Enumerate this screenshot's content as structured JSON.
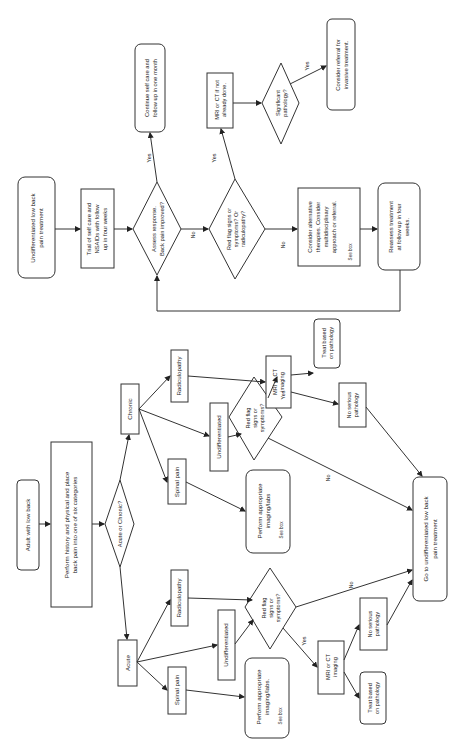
{
  "diagram": {
    "orientation": "rotated 90 degrees counter-clockwise",
    "nodes": {
      "adult": [
        "Adult with low back"
      ],
      "history": [
        "Perform history and physical and place",
        "back pain into one of six categories"
      ],
      "acute_chronic": [
        "Acute or Chronic?"
      ],
      "acute": [
        "Acute"
      ],
      "chronic": [
        "Chronic"
      ],
      "acute_spinal": [
        "Spinal pain"
      ],
      "acute_undiff": [
        "Undifferentiated"
      ],
      "acute_radic": [
        "Radiculopathy"
      ],
      "chronic_spinal": [
        "Spinal pain"
      ],
      "chronic_undiff": [
        "Undifferentiated"
      ],
      "chronic_radic": [
        "Radiculopathy"
      ],
      "acute_imaging_labs": [
        "Perform appropriate",
        "imaging/labs."
      ],
      "acute_imaging_labs_note": "See box",
      "chronic_imaging_labs": [
        "Perform appropriate",
        "imaging/labs"
      ],
      "chronic_imaging_labs_note": "See box",
      "acute_redflag": [
        "Red flag",
        "signs or",
        "symptoms?"
      ],
      "chronic_redflag": [
        "Red flag",
        "signs or",
        "symptoms?"
      ],
      "acute_mri": [
        "MRI or CT",
        "imaging"
      ],
      "chronic_mri": [
        "MRI or CT",
        "imaging"
      ],
      "acute_treat": [
        "Treat based",
        "on pathology"
      ],
      "chronic_treat": [
        "Treat based",
        "on pathology"
      ],
      "acute_noserious": [
        "No serious",
        "pathology"
      ],
      "chronic_noserious": [
        "No serious",
        "pathology"
      ],
      "goto_undiff": [
        "Go to undifferentiated low back",
        "pain treatment"
      ],
      "undiff_treatment": [
        "Undifferentiated low back",
        "pain treatment"
      ],
      "trial_selfcare": [
        "Trial of self care and",
        "NSAIDs with follow",
        "up in four weeks"
      ],
      "assess_response": [
        "Assess response.",
        "Back pain improved?"
      ],
      "continue_selfcare": [
        "Continue self care and",
        "follow up in one month"
      ],
      "redflag_radic": [
        "Red flag signs or",
        "symptoms? Or",
        "radiculopathy?"
      ],
      "mri_if_not_done": [
        "MRI or CT if not",
        "already done."
      ],
      "significant_pathology": [
        "Significant",
        "pathology?"
      ],
      "consider_referral": [
        "Consider referral for",
        "invasive treatment."
      ],
      "consider_alternative": [
        "Consider alternative",
        "therapies.  Consider",
        "multidisciplinary",
        "approach or referral."
      ],
      "consider_alternative_note": "See box",
      "reassess": [
        "Reassess treatment",
        "at follow up in four",
        "weeks."
      ]
    },
    "edge_labels": {
      "yes": "Yes",
      "no": "No"
    }
  }
}
